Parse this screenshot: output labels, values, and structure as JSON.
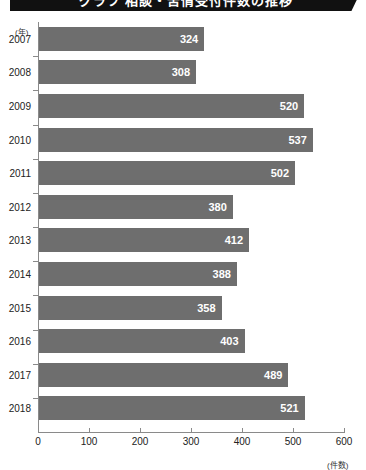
{
  "title": {
    "text": "グラフ 相談・苦情受付件数の推移",
    "clipped": true,
    "banner_color": "#111111"
  },
  "chart_data": {
    "type": "bar",
    "orientation": "horizontal",
    "title": "グラフ 相談・苦情受付件数の推移",
    "categories": [
      "2007",
      "2008",
      "2009",
      "2010",
      "2011",
      "2012",
      "2013",
      "2014",
      "2015",
      "2016",
      "2017",
      "2018"
    ],
    "values": [
      324,
      308,
      520,
      537,
      502,
      380,
      412,
      388,
      358,
      403,
      489,
      521
    ],
    "xlabel": "(件数)",
    "ylabel": "(年)",
    "xlim": [
      0,
      600
    ],
    "xticks": [
      0,
      100,
      200,
      300,
      400,
      500,
      600
    ],
    "xtick_labels": [
      "0",
      "100",
      "200",
      "300",
      "400",
      "500",
      "600"
    ],
    "grid": false,
    "legend": null,
    "bar_color": "#6e6e6e",
    "value_label_color": "#ffffff"
  },
  "axes": {
    "y_unit": "(年)",
    "x_unit": "(件数)"
  },
  "colors": {
    "bar": "#6e6e6e",
    "axis": "#8a8a8a",
    "banner": "#111111",
    "text": "#222222",
    "value_text": "#ffffff"
  }
}
